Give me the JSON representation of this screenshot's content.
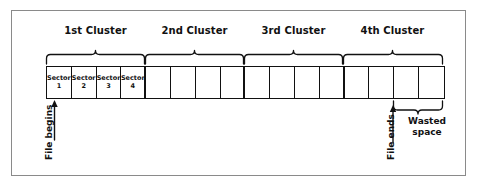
{
  "figure": {
    "background_color": "#ffffff",
    "frame_color": "#8a8a8a",
    "ink_color": "#111111"
  },
  "clusters": [
    {
      "label": "1st Cluster"
    },
    {
      "label": "2nd Cluster"
    },
    {
      "label": "3rd Cluster"
    },
    {
      "label": "4th Cluster"
    }
  ],
  "sectors": [
    {
      "name": "Sector",
      "number": "1",
      "labeled": true
    },
    {
      "name": "Sector",
      "number": "2",
      "labeled": true
    },
    {
      "name": "Sector",
      "number": "3",
      "labeled": true
    },
    {
      "name": "Sector",
      "number": "4",
      "labeled": true
    },
    {
      "name": "",
      "number": "",
      "labeled": false
    },
    {
      "name": "",
      "number": "",
      "labeled": false
    },
    {
      "name": "",
      "number": "",
      "labeled": false
    },
    {
      "name": "",
      "number": "",
      "labeled": false
    },
    {
      "name": "",
      "number": "",
      "labeled": false
    },
    {
      "name": "",
      "number": "",
      "labeled": false
    },
    {
      "name": "",
      "number": "",
      "labeled": false
    },
    {
      "name": "",
      "number": "",
      "labeled": false
    },
    {
      "name": "",
      "number": "",
      "labeled": false
    },
    {
      "name": "",
      "number": "",
      "labeled": false
    },
    {
      "name": "",
      "number": "",
      "labeled": false
    },
    {
      "name": "",
      "number": "",
      "labeled": false
    }
  ],
  "annotations": {
    "file_begins": "File begins",
    "file_ends": "File ends",
    "wasted_space_line1": "Wasted",
    "wasted_space_line2": "space"
  }
}
